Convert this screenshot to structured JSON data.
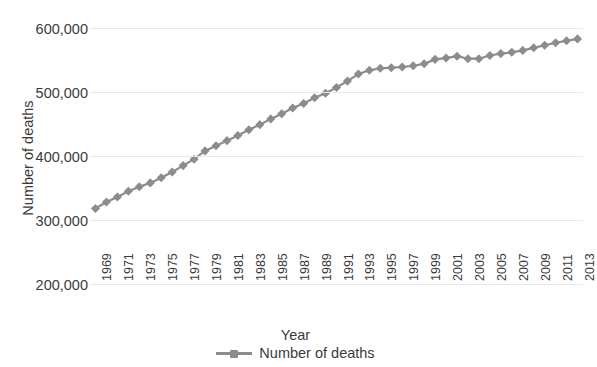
{
  "chart_data": {
    "type": "line",
    "title": "",
    "xlabel": "Year",
    "ylabel": "Number of deaths",
    "ylim": [
      200000,
      600000
    ],
    "yticks": [
      200000,
      300000,
      400000,
      500000,
      600000
    ],
    "ytick_labels": [
      "200,000",
      "300,000",
      "400,000",
      "500,000",
      "600,000"
    ],
    "grid": true,
    "legend_position": "bottom",
    "legend": [
      "Number of deaths"
    ],
    "x": [
      1969,
      1970,
      1971,
      1972,
      1973,
      1974,
      1975,
      1976,
      1977,
      1978,
      1979,
      1980,
      1981,
      1982,
      1983,
      1984,
      1985,
      1986,
      1987,
      1988,
      1989,
      1990,
      1991,
      1992,
      1993,
      1994,
      1995,
      1996,
      1997,
      1998,
      1999,
      2000,
      2001,
      2002,
      2003,
      2004,
      2005,
      2006,
      2007,
      2008,
      2009,
      2010,
      2011,
      2012,
      2013
    ],
    "xtick_labels": [
      "1969",
      "1971",
      "1973",
      "1975",
      "1977",
      "1979",
      "1981",
      "1983",
      "1985",
      "1987",
      "1989",
      "1991",
      "1993",
      "1995",
      "1997",
      "1999",
      "2001",
      "2003",
      "2005",
      "2007",
      "2009",
      "2011",
      "2013"
    ],
    "series": [
      {
        "name": "Number of deaths",
        "color": "#8c8c8c",
        "marker": "diamond",
        "values": [
          318000,
          328000,
          336000,
          345000,
          352000,
          358000,
          366000,
          375000,
          385000,
          395000,
          408000,
          416000,
          424000,
          432000,
          441000,
          449000,
          458000,
          466000,
          475000,
          482000,
          491000,
          498000,
          507000,
          517000,
          528000,
          534000,
          537000,
          538000,
          539000,
          541000,
          544000,
          551000,
          553000,
          556000,
          552000,
          552000,
          557000,
          560000,
          562000,
          565000,
          569000,
          573000,
          577000,
          580000,
          583000
        ]
      }
    ]
  }
}
